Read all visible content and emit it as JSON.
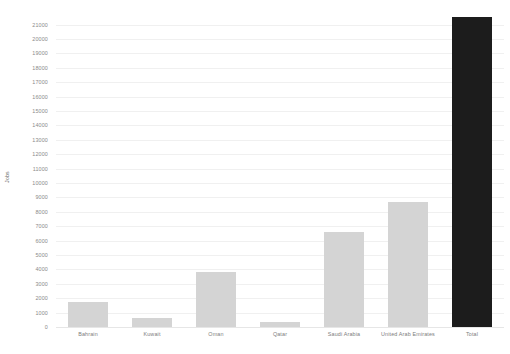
{
  "chart_data": {
    "type": "bar",
    "title": "",
    "xlabel": "",
    "ylabel": "Jobs",
    "categories": [
      "Bahrain",
      "Kuwait",
      "Oman",
      "Qatar",
      "Saudi Arabia",
      "United Arab Emirates",
      "Total"
    ],
    "values": [
      1760,
      640,
      3800,
      350,
      6600,
      8660,
      21550
    ],
    "ylim": [
      0,
      21000
    ],
    "ytick_step": 1000,
    "ytick_labels": [
      "0",
      "1000",
      "2000",
      "3000",
      "4000",
      "5000",
      "6000",
      "7000",
      "8000",
      "9000",
      "10000",
      "11000",
      "12000",
      "13000",
      "14000",
      "15000",
      "16000",
      "17000",
      "18000",
      "19000",
      "20000",
      "21000"
    ],
    "grid": true,
    "legend": "none",
    "colors": {
      "bar_default": "#d4d4d4",
      "bar_total": "#1c1c1c",
      "gridline": "#f0f0f0",
      "baseline": "#e6e6e6",
      "tick_text": "#8a8a8a",
      "axis_title": "#6e6e6e",
      "background": "#ffffff"
    },
    "bar_colors": [
      "#d4d4d4",
      "#d4d4d4",
      "#d4d4d4",
      "#d4d4d4",
      "#d4d4d4",
      "#d4d4d4",
      "#1c1c1c"
    ]
  }
}
